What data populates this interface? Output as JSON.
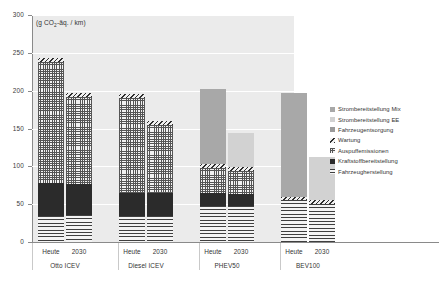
{
  "chart_data": {
    "type": "bar",
    "stacked": true,
    "title": "",
    "subtitle": "",
    "xlabel": "",
    "ylabel": "",
    "unit_label": "(g CO2-äq. / km)",
    "ylim": [
      0,
      300
    ],
    "yticks": [
      0,
      50,
      100,
      150,
      200,
      250,
      300
    ],
    "ytick_labels": [
      "0",
      "50",
      "100",
      "150",
      "200",
      "250",
      "300"
    ],
    "grid": true,
    "legend_position": "right",
    "groups": [
      {
        "name": "Otto ICEV",
        "subcategories": [
          "Heute",
          "2030"
        ]
      },
      {
        "name": "Diesel ICEV",
        "subcategories": [
          "Heute",
          "2030"
        ]
      },
      {
        "name": "PHEV50",
        "subcategories": [
          "Heute",
          "2030"
        ]
      },
      {
        "name": "BEV100",
        "subcategories": [
          "Heute",
          "2030"
        ]
      }
    ],
    "categories": [
      "Otto ICEV Heute",
      "Otto ICEV 2030",
      "Diesel ICEV Heute",
      "Diesel ICEV 2030",
      "PHEV50 Heute",
      "PHEV50 2030",
      "BEV100 Heute",
      "BEV100 2030"
    ],
    "series": [
      {
        "name": "Fahrzeugherstellung",
        "pattern": "horizontal-lines",
        "color": "#3f3f3f",
        "values": [
          35,
          36,
          34,
          35,
          47,
          48,
          55,
          55
        ]
      },
      {
        "name": "Kraftstoffbereitstellung",
        "pattern": "solid-dark",
        "color": "#2b2b2b",
        "values": [
          43,
          40,
          31,
          30,
          18,
          16,
          0,
          0
        ]
      },
      {
        "name": "Auspuffemissionen",
        "pattern": "dotted-grid",
        "color": "#555555",
        "values": [
          160,
          116,
          125,
          90,
          33,
          30,
          0,
          0
        ]
      },
      {
        "name": "Wartung",
        "pattern": "diagonal-hatch",
        "color": "#2e2e2e",
        "values": [
          5,
          5,
          5,
          5,
          5,
          5,
          5,
          5
        ]
      },
      {
        "name": "Fahrzeugentsorgung",
        "pattern": "solid-mid-gray",
        "color": "#9a9a9a",
        "values": [
          0,
          0,
          0,
          0,
          0,
          0,
          0,
          0
        ]
      },
      {
        "name": "Strombereitstellung EE",
        "pattern": "solid-light-gray",
        "color": "#d2d2d2",
        "values": [
          0,
          0,
          0,
          0,
          0,
          45,
          0,
          57
        ]
      },
      {
        "name": "Strombereitstellung Mix",
        "pattern": "solid-gray",
        "color": "#a8a8a8",
        "values": [
          0,
          0,
          0,
          0,
          99,
          0,
          137,
          0
        ]
      }
    ],
    "totals": [
      243,
      197,
      195,
      160,
      202,
      144,
      197,
      112
    ]
  },
  "legend": {
    "items": [
      {
        "label": "Strombereitstellung Mix",
        "pattern": "solid-gray"
      },
      {
        "label": "Strombereitstellung EE",
        "pattern": "solid-light-gray"
      },
      {
        "label": "Fahrzeugentsorgung",
        "pattern": "solid-mid-gray"
      },
      {
        "label": "Wartung",
        "pattern": "diagonal-hatch"
      },
      {
        "label": "Auspuffemissionen",
        "pattern": "dotted-grid"
      },
      {
        "label": "Kraftstoffbereitstellung",
        "pattern": "solid-dark"
      },
      {
        "label": "Fahrzeugherstellung",
        "pattern": "horizontal-lines"
      }
    ]
  }
}
